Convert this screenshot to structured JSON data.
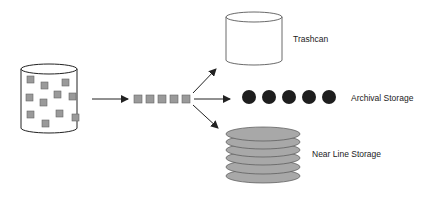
{
  "diagram": {
    "title": "",
    "source": {
      "name": "source-database",
      "item_count": 12
    },
    "queue": {
      "item_count": 5
    },
    "destinations": [
      {
        "id": "trashcan",
        "label": "Trashcan"
      },
      {
        "id": "archival",
        "label": "Archival Storage",
        "disc_count": 5
      },
      {
        "id": "nearline",
        "label": "Near Line Storage",
        "platter_count": 6
      }
    ]
  },
  "colors": {
    "stroke": "#222222",
    "item_fill": "#9a9a9a",
    "disc_fill": "#1e1e1e",
    "platter_fill": "#a8a8a8",
    "background": "#ffffff"
  }
}
